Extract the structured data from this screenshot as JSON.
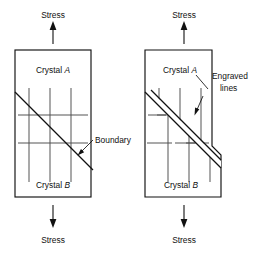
{
  "figure": {
    "caption_absent": true,
    "panels": [
      {
        "id": "left",
        "name": "before-deformation",
        "top_label": "Stress",
        "bottom_label": "Stress",
        "upper_crystal": "Crystal A",
        "lower_crystal": "Crystal B",
        "callout": "Boundary",
        "box": {
          "x": 15,
          "y": 50,
          "w": 76,
          "h": 147
        },
        "grid": {
          "vertical_x": [
            29,
            50,
            71
          ],
          "vertical_y1": 88,
          "vertical_y2": 182,
          "horizontal_y": [
            115,
            143
          ],
          "horizontal_x1": 18,
          "horizontal_x2": 88
        },
        "boundary": {
          "x1": 15,
          "y1": 92,
          "x2": 93,
          "y2": 170
        }
      },
      {
        "id": "right",
        "name": "after-deformation",
        "top_label": "Stress",
        "bottom_label": "Stress",
        "upper_crystal": "Crystal A",
        "lower_crystal": "Crystal B",
        "callout": "Engraved lines",
        "callout_line_1": "Engraved",
        "callout_line_2": "lines",
        "box_top": {
          "x": 145,
          "y": 50,
          "w": 67,
          "h": 0
        },
        "shear_offset": 9
      }
    ],
    "colors": {
      "ink": "#111111",
      "grid": "#4a4a4a",
      "background": "#ffffff"
    }
  }
}
